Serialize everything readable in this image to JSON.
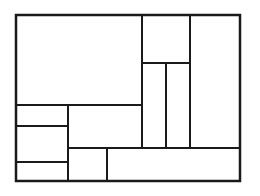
{
  "diagram": {
    "type": "rectangular-partition",
    "stroke_color": "#1a1a1a",
    "stroke_width": 2,
    "background": "#ffffff",
    "outer": {
      "x": 16,
      "y": 15,
      "w": 224,
      "h": 166
    },
    "regions": [
      {
        "id": "A",
        "x": 16,
        "y": 15,
        "w": 126,
        "h": 90
      },
      {
        "id": "B",
        "x": 142,
        "y": 15,
        "w": 48,
        "h": 48
      },
      {
        "id": "C",
        "x": 190,
        "y": 15,
        "w": 50,
        "h": 133
      },
      {
        "id": "D",
        "x": 142,
        "y": 63,
        "w": 24,
        "h": 85
      },
      {
        "id": "E",
        "x": 166,
        "y": 63,
        "w": 24,
        "h": 85
      },
      {
        "id": "F",
        "x": 16,
        "y": 105,
        "w": 52,
        "h": 21
      },
      {
        "id": "G",
        "x": 68,
        "y": 105,
        "w": 74,
        "h": 43
      },
      {
        "id": "H",
        "x": 16,
        "y": 126,
        "w": 52,
        "h": 36
      },
      {
        "id": "I",
        "x": 16,
        "y": 162,
        "w": 52,
        "h": 19
      },
      {
        "id": "J",
        "x": 68,
        "y": 148,
        "w": 39,
        "h": 33
      },
      {
        "id": "K",
        "x": 107,
        "y": 148,
        "w": 133,
        "h": 33
      }
    ]
  }
}
